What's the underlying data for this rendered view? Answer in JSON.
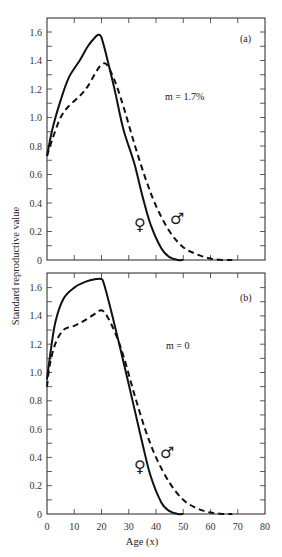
{
  "chart_data": [
    {
      "type": "line",
      "panel": "(a)",
      "annotation": "m = 1.7%",
      "xlabel": "Age (x)",
      "ylabel": "Standard reproductive value",
      "xlim": [
        0,
        80
      ],
      "ylim": [
        0,
        1.7
      ],
      "xticks": [
        0,
        10,
        20,
        30,
        40,
        50,
        60,
        70,
        80
      ],
      "yticks": [
        0,
        0.2,
        0.4,
        0.6,
        0.8,
        1.0,
        1.2,
        1.4,
        1.6
      ],
      "series": [
        {
          "name": "Female (♀)",
          "style": "solid",
          "x": [
            0,
            2,
            5,
            8,
            12,
            15,
            18,
            19,
            20,
            22,
            25,
            28,
            32,
            35,
            38,
            42,
            45,
            48,
            50
          ],
          "y": [
            0.73,
            0.92,
            1.12,
            1.28,
            1.4,
            1.5,
            1.57,
            1.58,
            1.56,
            1.42,
            1.18,
            0.92,
            0.68,
            0.45,
            0.25,
            0.08,
            0.02,
            0.0,
            0.0
          ]
        },
        {
          "name": "Male (♂)",
          "style": "dashed",
          "x": [
            0,
            2,
            5,
            8,
            12,
            15,
            18,
            20,
            22,
            25,
            28,
            32,
            36,
            40,
            45,
            50,
            55,
            60,
            65,
            68
          ],
          "y": [
            0.73,
            0.85,
            1.0,
            1.08,
            1.15,
            1.22,
            1.32,
            1.37,
            1.37,
            1.25,
            1.08,
            0.82,
            0.58,
            0.38,
            0.2,
            0.09,
            0.04,
            0.01,
            0.0,
            0.0
          ]
        }
      ],
      "symbols": [
        {
          "label": "♀",
          "x": 34,
          "y": 0.27
        },
        {
          "label": "♂",
          "x": 48,
          "y": 0.29
        }
      ]
    },
    {
      "type": "line",
      "panel": "(b)",
      "annotation": "m = 0",
      "xlabel": "Age (x)",
      "ylabel": "Standard reproductive value",
      "xlim": [
        0,
        80
      ],
      "ylim": [
        0,
        1.7
      ],
      "xticks": [
        0,
        10,
        20,
        30,
        40,
        50,
        60,
        70,
        80
      ],
      "yticks": [
        0,
        0.2,
        0.4,
        0.6,
        0.8,
        1.0,
        1.2,
        1.4,
        1.6
      ],
      "series": [
        {
          "name": "Female (♀)",
          "style": "solid",
          "x": [
            0,
            1,
            3,
            6,
            10,
            14,
            18,
            20,
            21,
            24,
            28,
            32,
            35,
            38,
            42,
            45,
            48,
            50
          ],
          "y": [
            0.95,
            1.1,
            1.35,
            1.52,
            1.6,
            1.64,
            1.66,
            1.66,
            1.62,
            1.4,
            1.08,
            0.75,
            0.5,
            0.27,
            0.08,
            0.02,
            0.0,
            0.0
          ]
        },
        {
          "name": "Male (♂)",
          "style": "dashed",
          "x": [
            0,
            1,
            3,
            6,
            10,
            14,
            18,
            20,
            22,
            25,
            28,
            32,
            36,
            40,
            45,
            50,
            55,
            60,
            65,
            68
          ],
          "y": [
            0.9,
            1.05,
            1.2,
            1.3,
            1.33,
            1.37,
            1.42,
            1.44,
            1.4,
            1.28,
            1.12,
            0.85,
            0.6,
            0.4,
            0.22,
            0.1,
            0.04,
            0.01,
            0.0,
            0.0
          ]
        }
      ],
      "symbols": [
        {
          "label": "♀",
          "x": 34,
          "y": 0.33
        },
        {
          "label": "♂",
          "x": 45,
          "y": 0.44
        }
      ]
    }
  ],
  "labels": {
    "panel_a": "(a)",
    "panel_b": "(b)",
    "annot_a": "m = 1.7%",
    "annot_b": "m = 0",
    "ylabel": "Standard reproductive value",
    "xlabel": "Age (x)",
    "female_symbol": "♀",
    "male_symbol": "♂"
  }
}
